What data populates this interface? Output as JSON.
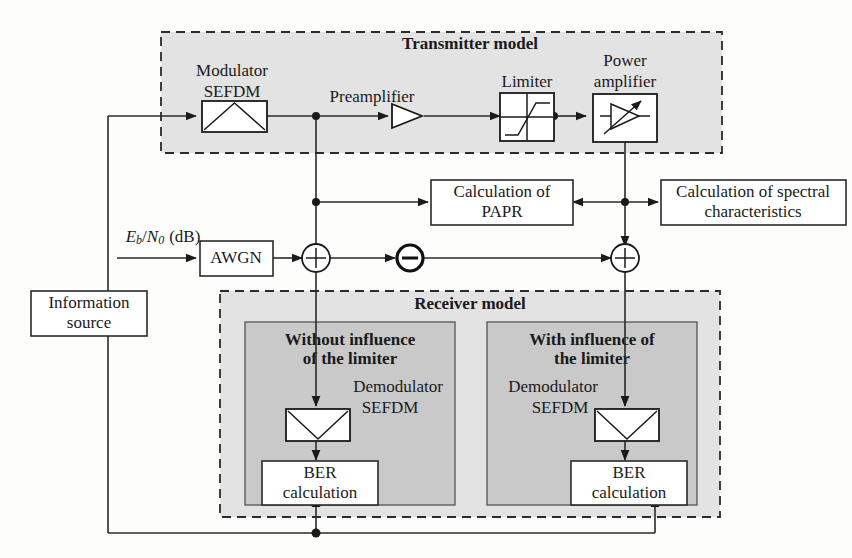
{
  "diagram": {
    "groups": {
      "transmitter": {
        "label": "Transmitter model"
      },
      "receiver": {
        "label": "Receiver model"
      },
      "branch_without": {
        "label_line1": "Without influence",
        "label_line2": "of the limiter"
      },
      "branch_with": {
        "label_line1": "With influence of",
        "label_line2": "the limiter"
      }
    },
    "blocks": {
      "modulator": {
        "label_line1": "Modulator",
        "label_line2": "SEFDM",
        "icon": "modulator-triangle-icon"
      },
      "preamplifier": {
        "label": "Preamplifier",
        "icon": "amplifier-triangle-icon"
      },
      "limiter": {
        "label": "Limiter",
        "icon": "limiter-saturation-icon"
      },
      "power_amplifier": {
        "label_line1": "Power",
        "label_line2": "amplifier",
        "icon": "variable-gain-amplifier-icon"
      },
      "papr": {
        "label_line1": "Calculation of",
        "label_line2": "PAPR"
      },
      "spectral": {
        "label_line1": "Calculation of spectral",
        "label_line2": "characteristics"
      },
      "awgn": {
        "label": "AWGN"
      },
      "information_source": {
        "label_line1": "Information",
        "label_line2": "source"
      },
      "demodulator_left": {
        "label_line1": "Demodulator",
        "label_line2": "SEFDM",
        "icon": "demodulator-triangle-icon"
      },
      "demodulator_right": {
        "label_line1": "Demodulator",
        "label_line2": "SEFDM",
        "icon": "demodulator-triangle-icon"
      },
      "ber_left": {
        "label_line1": "BER",
        "label_line2": "calculation"
      },
      "ber_right": {
        "label_line1": "BER",
        "label_line2": "calculation"
      }
    },
    "signals": {
      "ebn0": {
        "symbol_e": "E",
        "sub_b": "b",
        "slash": "/",
        "symbol_n": "N",
        "sub_0": "0",
        "unit": "(dB)"
      }
    },
    "operators": {
      "sum_left": {
        "symbol": "+",
        "icon": "summing-junction-icon"
      },
      "diff_middle": {
        "symbol": "−",
        "icon": "difference-junction-icon"
      },
      "sum_right": {
        "symbol": "+",
        "icon": "summing-junction-icon"
      }
    },
    "colors": {
      "group_fill": "#e3e3e3",
      "inner_fill": "#c9c9c9",
      "line": "#2a2a2a",
      "box_fill": "#ffffff",
      "text": "#1a1a1a"
    }
  }
}
